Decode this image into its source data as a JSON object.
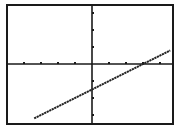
{
  "colors": {
    "background": "#ffffff",
    "frame": "#1a1a1a",
    "axis": "#1a1a1a",
    "line": "#222222"
  },
  "chart_data": {
    "type": "line",
    "title": "",
    "xlabel": "",
    "ylabel": "",
    "grid": false,
    "legend": "none",
    "xlim": [
      -4.9,
      4.9
    ],
    "ylim": [
      -3.5,
      3.5
    ],
    "x_ticks": [
      -4,
      -3,
      -2,
      -1,
      1,
      2,
      3,
      4
    ],
    "y_ticks": [
      -3,
      -2,
      -1,
      1,
      2,
      3
    ],
    "series": [
      {
        "name": "y = 0.5x - 1.5",
        "slope": 0.5,
        "intercept": -1.5,
        "x": [
          -3.4,
          4.6
        ],
        "y": [
          -3.2,
          0.8
        ]
      }
    ]
  }
}
